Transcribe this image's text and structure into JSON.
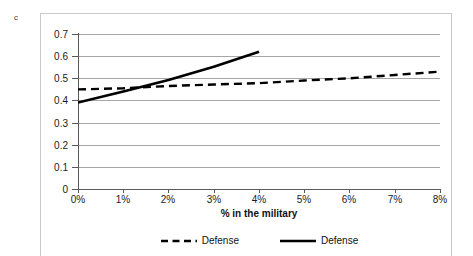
{
  "panel": {
    "label": "c"
  },
  "chart_data": {
    "type": "line",
    "title": "",
    "xlabel": "% in the military",
    "ylabel": "",
    "xlim": [
      0,
      8
    ],
    "ylim": [
      0,
      0.7
    ],
    "grid": true,
    "legend_position": "bottom",
    "x_ticklabels": [
      "0%",
      "1%",
      "2%",
      "3%",
      "4%",
      "5%",
      "6%",
      "7%",
      "8%"
    ],
    "x_tickvalues": [
      0,
      1,
      2,
      3,
      4,
      5,
      6,
      7,
      8
    ],
    "y_ticklabels": [
      "0.7",
      "0.6",
      "0.5",
      "0.4",
      "0.3",
      "0.2",
      "0.1",
      "0"
    ],
    "y_tickvalues": [
      0.7,
      0.6,
      0.5,
      0.4,
      0.3,
      0.2,
      0.1,
      0
    ],
    "series": [
      {
        "name": "Defense",
        "style": "dashed",
        "color": "#000000",
        "x": [
          0,
          1,
          2,
          3,
          4,
          5,
          6,
          7,
          8
        ],
        "values": [
          0.45,
          0.455,
          0.465,
          0.472,
          0.478,
          0.49,
          0.5,
          0.515,
          0.53
        ]
      },
      {
        "name": "Defense",
        "style": "solid",
        "color": "#000000",
        "x": [
          0,
          1,
          2,
          3,
          4
        ],
        "values": [
          0.39,
          0.44,
          0.492,
          0.552,
          0.62
        ]
      }
    ],
    "legend": [
      {
        "label": "Defense",
        "style": "dashed"
      },
      {
        "label": "Defense",
        "style": "solid"
      }
    ]
  }
}
